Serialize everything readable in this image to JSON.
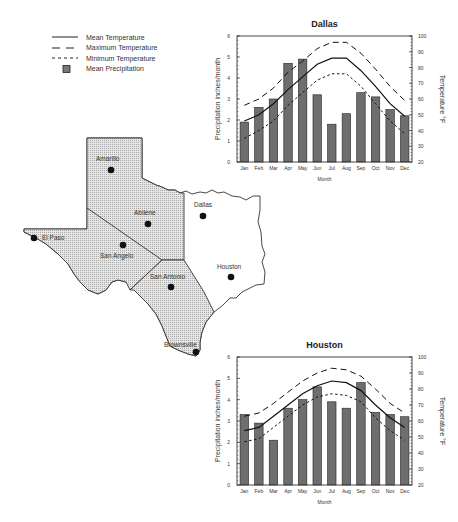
{
  "legend": {
    "items": [
      {
        "label": "Mean Temperature",
        "style": "solid"
      },
      {
        "label": "Maximum Temperature",
        "style": "longdash"
      },
      {
        "label": "Minimum Temperature",
        "style": "shortdash"
      },
      {
        "label": "Mean Precipitation",
        "style": "bar"
      }
    ]
  },
  "map": {
    "cities": [
      {
        "name": "Amarillo",
        "x": 111,
        "y": 170,
        "lx": 96,
        "ly": 155,
        "shaded": true
      },
      {
        "name": "Abilene",
        "x": 148,
        "y": 224,
        "lx": 134,
        "ly": 209,
        "shaded": true
      },
      {
        "name": "El Paso",
        "x": 34,
        "y": 238,
        "lx": 42,
        "ly": 234,
        "shaded": true
      },
      {
        "name": "San Angelo",
        "x": 123,
        "y": 245,
        "lx": 100,
        "ly": 252,
        "shaded": true
      },
      {
        "name": "Dallas",
        "x": 203,
        "y": 216,
        "lx": 194,
        "ly": 201,
        "shaded": false
      },
      {
        "name": "Houston",
        "x": 231,
        "y": 277,
        "lx": 217,
        "ly": 263,
        "shaded": false
      },
      {
        "name": "San Antonio",
        "x": 171,
        "y": 287,
        "lx": 150,
        "ly": 273,
        "shaded": true
      },
      {
        "name": "Brownsville",
        "x": 196,
        "y": 352,
        "lx": 164,
        "ly": 341,
        "shaded": true
      }
    ],
    "shade_color": "#cfcfcf",
    "border_color": "#333333"
  },
  "chart_data": [
    {
      "type": "bar+line",
      "title": "Dallas",
      "xlabel": "Month",
      "ylabel": "Precipitation inches/month",
      "y2label": "Temperature °F",
      "categories": [
        "Jan",
        "Feb",
        "Mar",
        "Apr",
        "May",
        "Jun",
        "Jul",
        "Aug",
        "Sep",
        "Oct",
        "Nov",
        "Dec"
      ],
      "ylim": [
        0,
        6
      ],
      "y2lim": [
        20,
        100
      ],
      "yticks": [
        0,
        1,
        2,
        3,
        4,
        5,
        6
      ],
      "y2ticks": [
        20,
        30,
        40,
        50,
        60,
        70,
        80,
        90,
        100
      ],
      "series": [
        {
          "name": "Mean Precipitation",
          "type": "bar",
          "axis": "left",
          "values": [
            1.9,
            2.6,
            3.0,
            4.7,
            4.9,
            3.2,
            1.8,
            2.3,
            3.3,
            3.1,
            2.5,
            2.2
          ]
        },
        {
          "name": "Mean Temperature",
          "type": "line",
          "style": "solid",
          "axis": "right",
          "values": [
            46,
            50,
            57,
            66,
            74,
            82,
            86,
            86,
            78,
            68,
            57,
            49
          ]
        },
        {
          "name": "Maximum Temperature",
          "type": "line",
          "style": "longdash",
          "axis": "right",
          "values": [
            56,
            60,
            67,
            77,
            84,
            92,
            96,
            96,
            89,
            79,
            68,
            59
          ]
        },
        {
          "name": "Minimum Temperature",
          "type": "line",
          "style": "shortdash",
          "axis": "right",
          "values": [
            35,
            40,
            46,
            56,
            64,
            72,
            76,
            76,
            68,
            57,
            46,
            38
          ]
        }
      ],
      "box": {
        "left": 237,
        "top": 36,
        "right": 412,
        "bottom": 162
      },
      "grid": false
    },
    {
      "type": "bar+line",
      "title": "Houston",
      "xlabel": "Month",
      "ylabel": "Precipitation inches/month",
      "y2label": "Temperature °F",
      "categories": [
        "Jan",
        "Feb",
        "Mar",
        "Apr",
        "May",
        "Jun",
        "Jul",
        "Aug",
        "Sep",
        "Oct",
        "Nov",
        "Dec"
      ],
      "ylim": [
        0,
        6
      ],
      "y2lim": [
        20,
        100
      ],
      "yticks": [
        0,
        1,
        2,
        3,
        4,
        5,
        6
      ],
      "y2ticks": [
        20,
        30,
        40,
        50,
        60,
        70,
        80,
        90,
        100
      ],
      "series": [
        {
          "name": "Mean Precipitation",
          "type": "bar",
          "axis": "left",
          "values": [
            3.3,
            2.9,
            2.1,
            3.6,
            4.0,
            4.6,
            3.9,
            3.6,
            4.8,
            3.4,
            3.3,
            3.2
          ]
        },
        {
          "name": "Mean Temperature",
          "type": "line",
          "style": "solid",
          "axis": "right",
          "values": [
            54,
            56,
            63,
            70,
            77,
            82,
            85,
            84,
            79,
            70,
            62,
            56
          ]
        },
        {
          "name": "Maximum Temperature",
          "type": "line",
          "style": "longdash",
          "axis": "right",
          "values": [
            63,
            65,
            71,
            78,
            85,
            90,
            93,
            92,
            88,
            80,
            71,
            65
          ]
        },
        {
          "name": "Minimum Temperature",
          "type": "line",
          "style": "shortdash",
          "axis": "right",
          "values": [
            47,
            49,
            56,
            63,
            70,
            75,
            77,
            76,
            72,
            62,
            54,
            48
          ]
        }
      ],
      "box": {
        "left": 237,
        "top": 357,
        "right": 412,
        "bottom": 485
      },
      "grid": false
    }
  ]
}
